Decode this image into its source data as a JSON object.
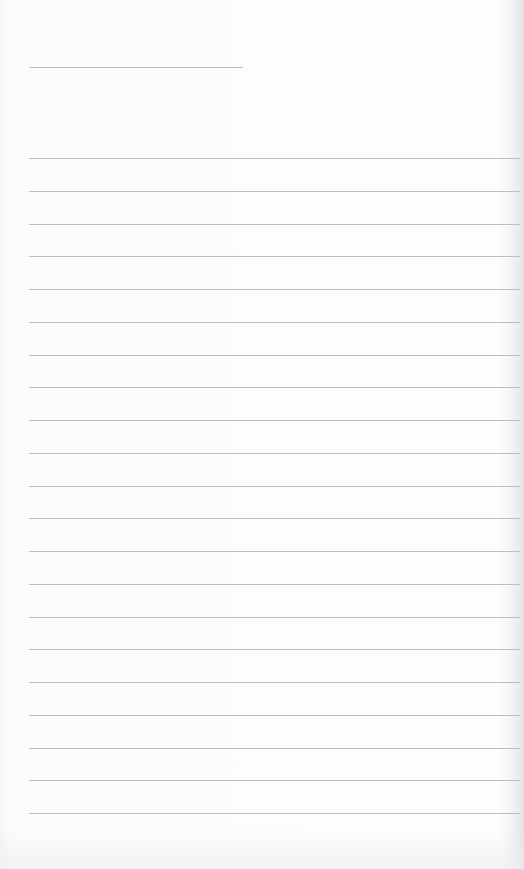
{
  "paper": {
    "type": "lined-notepad",
    "background_color": "#fbfbfb",
    "line_color": "#bdbdbd",
    "title_line": {
      "present": true,
      "text": ""
    },
    "ruled_lines": {
      "count": 21,
      "first_y": 158,
      "spacing": 32.75
    },
    "content_lines": [
      "",
      "",
      "",
      "",
      "",
      "",
      "",
      "",
      "",
      "",
      "",
      "",
      "",
      "",
      "",
      "",
      "",
      "",
      "",
      "",
      ""
    ]
  }
}
